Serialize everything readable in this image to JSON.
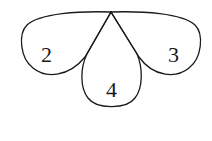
{
  "diagram": {
    "vertex": {
      "x": 111,
      "y": 12
    },
    "lobes": [
      {
        "id": "left",
        "label": "2"
      },
      {
        "id": "bottom",
        "label": "4"
      },
      {
        "id": "right",
        "label": "3"
      }
    ],
    "stroke_color": "#1a1a1a",
    "background": "#ffffff"
  }
}
